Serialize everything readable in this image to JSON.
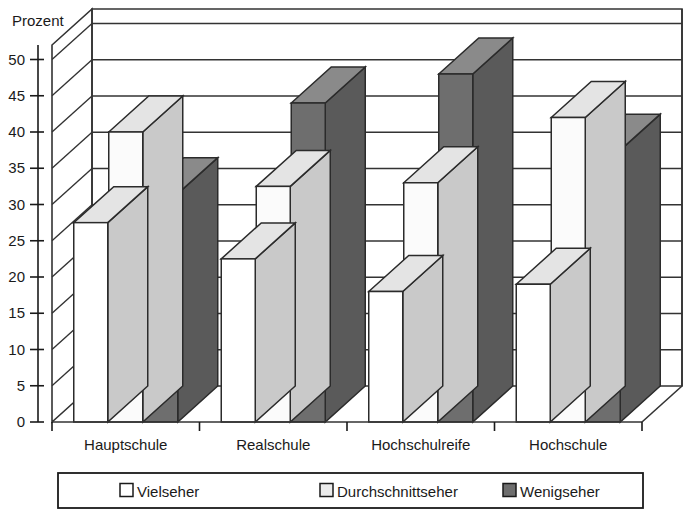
{
  "chart_data": {
    "type": "bar",
    "title": "",
    "ylabel": "Prozent",
    "xlabel": "",
    "categories": [
      "Hauptschule",
      "Realschule",
      "Hochschulreife",
      "Hochschule"
    ],
    "series": [
      {
        "name": "Vielseher",
        "values": [
          27.5,
          22.5,
          18.0,
          19.0
        ],
        "color": "#ffffff"
      },
      {
        "name": "Durchschnittseher",
        "values": [
          40.0,
          32.5,
          33.0,
          42.0
        ],
        "color": "#ebebeb"
      },
      {
        "name": "Wenigseher",
        "values": [
          31.5,
          44.0,
          48.0,
          37.5
        ],
        "color": "#6e6e6e"
      }
    ],
    "ylim": [
      0,
      52
    ],
    "yticks": [
      0,
      5,
      10,
      15,
      20,
      25,
      30,
      35,
      40,
      45,
      50
    ],
    "ytick_labels": [
      "0",
      "5",
      "10",
      "15",
      "20",
      "25",
      "30",
      "35",
      "40",
      "45",
      "50"
    ],
    "gridlines": [
      5,
      10,
      15,
      20,
      25,
      30,
      35,
      40,
      45,
      50
    ],
    "grid": true,
    "legend_position": "bottom",
    "projection": "3d"
  },
  "legend": {
    "entries": [
      {
        "label": "Vielseher",
        "swatch": "#ffffff"
      },
      {
        "label": "Durchschnittseher",
        "swatch": "#ebebeb"
      },
      {
        "label": "Wenigseher",
        "swatch": "#6e6e6e"
      }
    ]
  },
  "axes": {
    "y_axis_title": "Prozent",
    "y_tick_labels": [
      "50",
      "45",
      "40",
      "35",
      "30",
      "25",
      "20",
      "15",
      "10",
      "5",
      "0"
    ],
    "x_tick_labels": [
      "Hauptschule",
      "Realschule",
      "Hochschulreife",
      "Hochschule"
    ]
  },
  "colors": {
    "bar_front_vielseher": "#ffffff",
    "bar_front_durchschnitt": "#fbfbfb",
    "bar_front_wenig": "#6e6e6e",
    "bar_top_light": "#e4e4e4",
    "bar_side_light": "#c9c9c9",
    "bar_top_dark": "#8a8a8a",
    "bar_side_dark": "#5a5a5a",
    "outline": "#2b2b2b",
    "grid": "#333333",
    "text": "#1a1a1a",
    "background": "#ffffff"
  }
}
